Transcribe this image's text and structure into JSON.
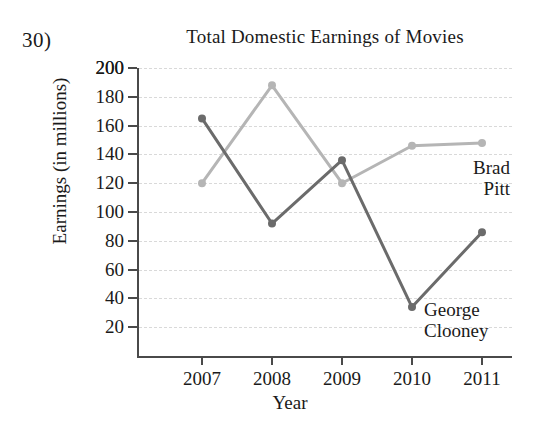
{
  "question_number": "30)",
  "chart_data": {
    "type": "line",
    "title": "Total Domestic Earnings of Movies",
    "xlabel": "Year",
    "ylabel": "Earnings (in millions)",
    "categories": [
      "2007",
      "2008",
      "2009",
      "2010",
      "2011"
    ],
    "yticks": [
      20,
      40,
      60,
      80,
      100,
      120,
      140,
      160,
      180,
      200
    ],
    "ylim": [
      0,
      200
    ],
    "grid": true,
    "legend_position": "inline-right",
    "series": [
      {
        "name": "Brad Pitt",
        "label_lines": [
          "Brad",
          "Pitt"
        ],
        "color": "#b5b5b5",
        "values": [
          120,
          188,
          120,
          146,
          148
        ]
      },
      {
        "name": "George Clooney",
        "label_lines": [
          "George",
          "Clooney"
        ],
        "color": "#6b6b6b",
        "values": [
          165,
          92,
          136,
          34,
          86
        ]
      }
    ]
  }
}
